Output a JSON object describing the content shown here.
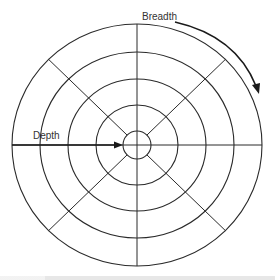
{
  "diagram": {
    "type": "concentric-circle search-space diagram",
    "center": {
      "x": 137,
      "y": 145
    },
    "rings": [
      {
        "rx": 14,
        "ry": 14
      },
      {
        "rx": 41,
        "ry": 40
      },
      {
        "rx": 69,
        "ry": 66
      },
      {
        "rx": 97,
        "ry": 93
      },
      {
        "rx": 125,
        "ry": 121
      }
    ],
    "spokes": {
      "axis_lines": [
        "horizontal",
        "vertical"
      ],
      "diagonal_angles_deg": [
        45,
        135,
        225,
        315
      ]
    },
    "labels": {
      "breadth": "Breadth",
      "depth": "Depth"
    },
    "colors": {
      "line": "#2a2a2a",
      "arrow": "#1a1a1a",
      "text": "#333333",
      "background": "#ffffff"
    }
  }
}
